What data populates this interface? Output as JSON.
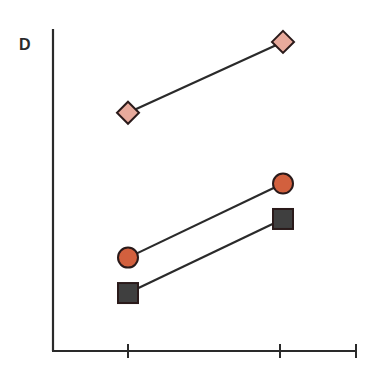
{
  "panel": {
    "label": "D"
  },
  "chart_data": {
    "type": "line",
    "title": "",
    "panel_label": "D",
    "xlabel": "",
    "ylabel": "",
    "categories": [
      "",
      ""
    ],
    "x_ticks": 3,
    "axis_ticks_labels": [],
    "grid": false,
    "legend": null,
    "series": [
      {
        "name": "diamond-series",
        "marker": "diamond",
        "color": "#e8aa9c",
        "values": [
          0.74,
          0.96
        ]
      },
      {
        "name": "circle-series",
        "marker": "circle",
        "color": "#d2603e",
        "values": [
          0.29,
          0.52
        ]
      },
      {
        "name": "square-series",
        "marker": "square",
        "color": "#3f3f3f",
        "values": [
          0.18,
          0.41
        ]
      }
    ],
    "ylim": [
      0,
      1
    ],
    "note": "No numeric tick labels are shown; values are relative positions (0 = x-axis, 1 = top of y-axis)."
  },
  "colors": {
    "axis": "#2a2a2a",
    "line": "#2a2a2a",
    "diamond": "#e8aa9c",
    "circle": "#d2603e",
    "square": "#3f3f3f"
  }
}
